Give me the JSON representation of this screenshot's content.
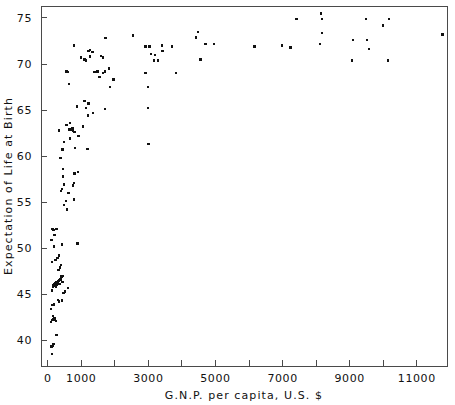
{
  "chart_data": {
    "type": "scatter",
    "title": "",
    "xlabel": "G.N.P.  per  capita,  U.S.  $",
    "ylabel": "Expectation  of  Life  at  Birth",
    "xlim": [
      -200,
      11900
    ],
    "ylim": [
      37.2,
      76.3
    ],
    "grid": false,
    "legend": null,
    "x_ticks_major": [
      0,
      1000,
      3000,
      5000,
      7000,
      9000,
      11000
    ],
    "x_tick_labels": [
      "0",
      "1000",
      "3000",
      "5000",
      "7000",
      "9000",
      "11000"
    ],
    "x_ticks_minor": [
      2000,
      4000,
      6000,
      8000,
      10000
    ],
    "y_ticks_major": [
      40,
      45,
      50,
      55,
      60,
      65,
      70,
      75
    ],
    "y_tick_labels": [
      "40",
      "45",
      "50",
      "55",
      "60",
      "65",
      "70",
      "75"
    ],
    "marker": "square",
    "marker_color": "#111111",
    "marker_size_px": 2.4,
    "series": [
      {
        "name": "countries",
        "points": [
          [
            120,
            38.5
          ],
          [
            150,
            39.4
          ],
          [
            170,
            39.6
          ],
          [
            110,
            39.3
          ],
          [
            260,
            40.6
          ],
          [
            90,
            42.0
          ],
          [
            130,
            42.2
          ],
          [
            160,
            42.3
          ],
          [
            180,
            42.4
          ],
          [
            200,
            42.2
          ],
          [
            150,
            42.6
          ],
          [
            210,
            42.4
          ],
          [
            240,
            42.1
          ],
          [
            100,
            43.4
          ],
          [
            140,
            43.8
          ],
          [
            190,
            43.9
          ],
          [
            300,
            44.4
          ],
          [
            340,
            44.2
          ],
          [
            420,
            44.3
          ],
          [
            470,
            45.1
          ],
          [
            510,
            45.3
          ],
          [
            600,
            45.7
          ],
          [
            120,
            45.4
          ],
          [
            150,
            45.8
          ],
          [
            165,
            46.0
          ],
          [
            180,
            45.9
          ],
          [
            195,
            46.1
          ],
          [
            205,
            45.9
          ],
          [
            215,
            46.2
          ],
          [
            230,
            46.0
          ],
          [
            245,
            45.8
          ],
          [
            255,
            46.1
          ],
          [
            265,
            46.3
          ],
          [
            280,
            46.0
          ],
          [
            295,
            46.2
          ],
          [
            310,
            46.4
          ],
          [
            330,
            46.5
          ],
          [
            350,
            46.1
          ],
          [
            380,
            46.6
          ],
          [
            410,
            46.9
          ],
          [
            440,
            46.3
          ],
          [
            460,
            47.0
          ],
          [
            320,
            47.6
          ],
          [
            360,
            47.9
          ],
          [
            400,
            48.2
          ],
          [
            130,
            48.5
          ],
          [
            230,
            48.7
          ],
          [
            290,
            48.9
          ],
          [
            340,
            49.2
          ],
          [
            180,
            50.2
          ],
          [
            420,
            50.4
          ],
          [
            890,
            50.5
          ],
          [
            110,
            50.9
          ],
          [
            200,
            51.4
          ],
          [
            140,
            52.1
          ],
          [
            175,
            52.0
          ],
          [
            260,
            52.1
          ],
          [
            570,
            54.2
          ],
          [
            480,
            54.7
          ],
          [
            540,
            55.1
          ],
          [
            780,
            55.3
          ],
          [
            620,
            56.0
          ],
          [
            400,
            56.2
          ],
          [
            420,
            56.4
          ],
          [
            760,
            56.8
          ],
          [
            480,
            56.9
          ],
          [
            780,
            57.1
          ],
          [
            460,
            57.8
          ],
          [
            800,
            58.1
          ],
          [
            900,
            58.3
          ],
          [
            450,
            58.6
          ],
          [
            380,
            59.8
          ],
          [
            440,
            60.7
          ],
          [
            820,
            60.9
          ],
          [
            1180,
            60.8
          ],
          [
            3000,
            61.3
          ],
          [
            480,
            61.5
          ],
          [
            660,
            61.9
          ],
          [
            920,
            62.2
          ],
          [
            330,
            62.8
          ],
          [
            640,
            62.9
          ],
          [
            700,
            62.9
          ],
          [
            740,
            63.0
          ],
          [
            760,
            62.7
          ],
          [
            800,
            62.6
          ],
          [
            560,
            63.4
          ],
          [
            660,
            63.6
          ],
          [
            1060,
            63.2
          ],
          [
            1200,
            64.4
          ],
          [
            1350,
            64.7
          ],
          [
            1710,
            65.1
          ],
          [
            2990,
            65.2
          ],
          [
            870,
            65.4
          ],
          [
            1140,
            65.2
          ],
          [
            1220,
            65.7
          ],
          [
            1100,
            66.0
          ],
          [
            1860,
            67.5
          ],
          [
            2990,
            67.5
          ],
          [
            640,
            67.8
          ],
          [
            1960,
            68.3
          ],
          [
            1540,
            68.6
          ],
          [
            1650,
            69.0
          ],
          [
            1400,
            69.1
          ],
          [
            1480,
            69.2
          ],
          [
            1700,
            69.2
          ],
          [
            2910,
            69.0
          ],
          [
            3830,
            69.0
          ],
          [
            560,
            69.2
          ],
          [
            600,
            69.1
          ],
          [
            1820,
            69.5
          ],
          [
            1100,
            70.5
          ],
          [
            1140,
            70.4
          ],
          [
            3160,
            70.4
          ],
          [
            3280,
            70.4
          ],
          [
            4550,
            70.5
          ],
          [
            9060,
            70.4
          ],
          [
            10140,
            70.4
          ],
          [
            1000,
            70.7
          ],
          [
            1260,
            70.8
          ],
          [
            1640,
            70.7
          ],
          [
            1580,
            70.9
          ],
          [
            3200,
            71.0
          ],
          [
            3080,
            71.1
          ],
          [
            1220,
            71.4
          ],
          [
            1260,
            71.5
          ],
          [
            1340,
            71.3
          ],
          [
            3420,
            71.4
          ],
          [
            9580,
            71.6
          ],
          [
            790,
            72.0
          ],
          [
            2920,
            71.9
          ],
          [
            3030,
            71.9
          ],
          [
            3400,
            72.0
          ],
          [
            3700,
            71.9
          ],
          [
            6160,
            71.9
          ],
          [
            6990,
            72.0
          ],
          [
            7240,
            71.8
          ],
          [
            8120,
            72.2
          ],
          [
            9100,
            72.6
          ],
          [
            9520,
            72.6
          ],
          [
            4700,
            72.2
          ],
          [
            4960,
            72.2
          ],
          [
            2550,
            73.1
          ],
          [
            1720,
            72.8
          ],
          [
            11760,
            73.2
          ],
          [
            4480,
            73.5
          ],
          [
            8180,
            73.4
          ],
          [
            4420,
            72.9
          ],
          [
            9990,
            74.2
          ],
          [
            7420,
            74.9
          ],
          [
            8140,
            75.5
          ],
          [
            8180,
            74.9
          ],
          [
            9490,
            74.9
          ],
          [
            10180,
            74.9
          ]
        ]
      }
    ]
  },
  "plot_geometry": {
    "left": 41,
    "right": 447,
    "top": 6,
    "bottom": 366
  }
}
